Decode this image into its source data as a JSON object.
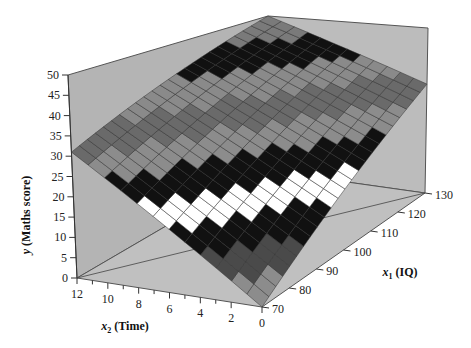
{
  "chart_data": {
    "type": "surface3d",
    "title": "",
    "xlabel": {
      "var": "x",
      "sub": "1",
      "text": "(IQ)"
    },
    "zlabel_time": {
      "var": "x",
      "sub": "2",
      "text": "(Time)"
    },
    "ylabel": {
      "var": "y",
      "text": "(Maths score)"
    },
    "x1_range": [
      70,
      130
    ],
    "x2_range": [
      0,
      12
    ],
    "y_range": [
      0,
      50
    ],
    "x1_ticks": [
      "70",
      "80",
      "90",
      "100",
      "110",
      "120",
      "130"
    ],
    "x2_ticks": [
      "12",
      "10",
      "8",
      "6",
      "4",
      "2",
      "0"
    ],
    "y_ticks": [
      "0",
      "5",
      "10",
      "15",
      "20",
      "25",
      "30",
      "35",
      "40",
      "45",
      "50"
    ],
    "surface_corners": [
      {
        "x1": 70,
        "x2": 0,
        "y": 0
      },
      {
        "x1": 130,
        "x2": 0,
        "y": 33
      },
      {
        "x1": 70,
        "x2": 12,
        "y": 31
      },
      {
        "x1": 130,
        "x2": 12,
        "y": 50
      }
    ],
    "band_width": 5,
    "band_shades": [
      "#8c8c8c",
      "#4a4a4a",
      "#111111",
      "#ffffff",
      "#111111",
      "#8c8c8c",
      "#6a6a6a",
      "#8a8a8a",
      "#111111",
      "#7a7a7a",
      "#5a5a5a"
    ],
    "grid_mesh": true,
    "wall_color": "#b4b4b4",
    "floor_color": "#c0c0c0"
  }
}
